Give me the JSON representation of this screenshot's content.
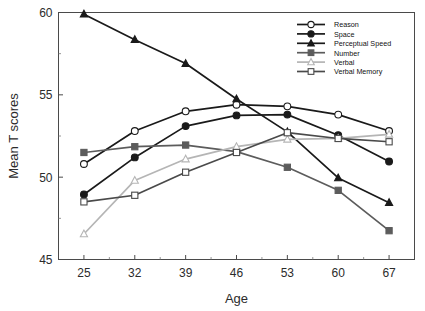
{
  "chart_data": {
    "type": "line",
    "title": "",
    "xlabel": "Age",
    "ylabel": "Mean T scores",
    "categories": [
      25,
      32,
      39,
      46,
      53,
      60,
      67
    ],
    "xtick_labels": [
      "25",
      "32",
      "39",
      "46",
      "53",
      "60",
      "67"
    ],
    "ytick_labels": [
      "45",
      "50",
      "55",
      "60"
    ],
    "yticks": [
      45,
      50,
      55,
      60
    ],
    "yminor_ticks": [
      47.5,
      52.5,
      57.5
    ],
    "ylim": [
      45,
      60
    ],
    "xlim": [
      21.5,
      70.5
    ],
    "grid": false,
    "legend_position": "top-right",
    "series": [
      {
        "name": "Reason",
        "marker": "open-circle",
        "color": "#1a1a1a",
        "fill": "#ffffff",
        "values": [
          50.8,
          52.8,
          54.0,
          54.4,
          54.3,
          53.8,
          52.8
        ]
      },
      {
        "name": "Space",
        "marker": "filled-circle",
        "color": "#1a1a1a",
        "fill": "#1a1a1a",
        "values": [
          48.95,
          51.2,
          53.1,
          53.75,
          53.8,
          52.55,
          50.95
        ]
      },
      {
        "name": "Perceptual Speed",
        "marker": "filled-triangle",
        "color": "#1a1a1a",
        "fill": "#1a1a1a",
        "values": [
          59.9,
          58.35,
          56.9,
          54.75,
          52.75,
          49.95,
          48.45
        ]
      },
      {
        "name": "Number",
        "marker": "filled-square",
        "color": "#5c5c5c",
        "fill": "#5c5c5c",
        "values": [
          51.5,
          51.85,
          51.95,
          51.55,
          50.6,
          49.2,
          46.75
        ]
      },
      {
        "name": "Verbal",
        "marker": "open-triangle",
        "color": "#b5b5b5",
        "fill": "#ffffff",
        "values": [
          46.55,
          49.8,
          51.1,
          51.85,
          52.3,
          52.35,
          52.6
        ]
      },
      {
        "name": "Verbal Memory",
        "marker": "open-square",
        "color": "#4a4a4a",
        "fill": "#ffffff",
        "values": [
          48.5,
          48.9,
          50.3,
          51.5,
          52.7,
          52.35,
          52.15
        ]
      }
    ]
  }
}
